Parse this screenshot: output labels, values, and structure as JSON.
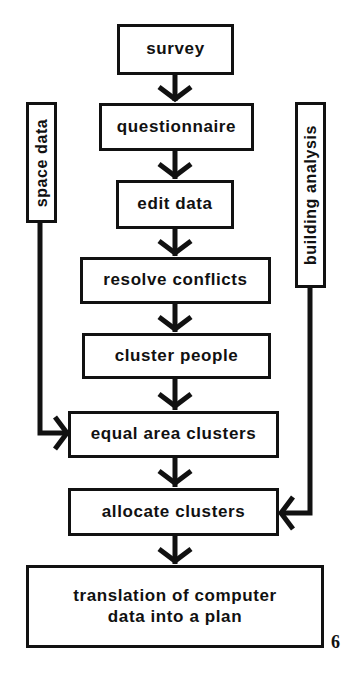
{
  "diagram": {
    "type": "flowchart",
    "steps": [
      {
        "id": "survey",
        "label": "survey"
      },
      {
        "id": "questionnaire",
        "label": "questionnaire"
      },
      {
        "id": "edit-data",
        "label": "edit data"
      },
      {
        "id": "resolve-conflicts",
        "label": "resolve conflicts"
      },
      {
        "id": "cluster-people",
        "label": "cluster people"
      },
      {
        "id": "equal-area-clusters",
        "label": "equal area clusters"
      },
      {
        "id": "allocate-clusters",
        "label": "allocate clusters"
      },
      {
        "id": "translation",
        "label_line1": "translation of computer",
        "label_line2": "data into a plan"
      }
    ],
    "side_inputs": [
      {
        "id": "space-data",
        "label": "space data",
        "feeds_into": "equal-area-clusters"
      },
      {
        "id": "building-analysis",
        "label": "building analysis",
        "feeds_into": "allocate-clusters"
      }
    ],
    "figure_number": "6",
    "colors": {
      "ink": "#111111",
      "background": "#ffffff"
    }
  }
}
